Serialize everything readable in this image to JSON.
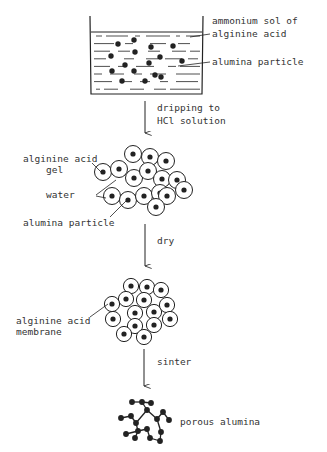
{
  "diagram": {
    "type": "process-flow",
    "ink_color": "#222222",
    "stages": [
      {
        "id": "sol",
        "name": "beaker",
        "labels": [
          "ammonium sol of",
          "alginine acid",
          "alumina particle"
        ]
      },
      {
        "id": "gel",
        "name": "gel-cluster",
        "labels": [
          "alginine acid",
          "gel",
          "water",
          "alumina particle"
        ]
      },
      {
        "id": "membrane",
        "name": "membrane-cluster",
        "labels": [
          "alginine acid",
          "membrane"
        ]
      },
      {
        "id": "porous",
        "name": "porous-network",
        "labels": [
          "porous alumina"
        ]
      }
    ],
    "steps": [
      {
        "label_lines": [
          "dripping to",
          "HCl solution"
        ]
      },
      {
        "label_lines": [
          "dry"
        ]
      },
      {
        "label_lines": [
          "sinter"
        ]
      }
    ]
  }
}
